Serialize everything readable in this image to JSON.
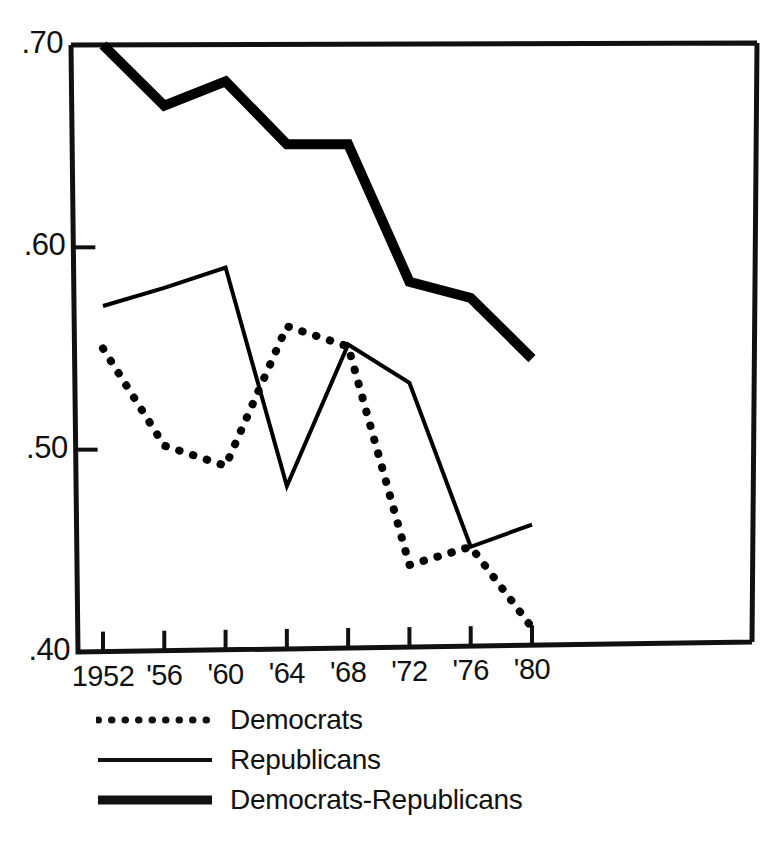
{
  "chart_data": {
    "type": "line",
    "title": "",
    "subtitle": "",
    "xlabel": "",
    "ylabel": "",
    "x": [
      1952,
      1956,
      1960,
      1964,
      1968,
      1972,
      1976,
      1980
    ],
    "categories": [
      "1952",
      "'56",
      "'60",
      "'64",
      "'68",
      "'72",
      "'76",
      "'80"
    ],
    "xlim": [
      1950,
      1982
    ],
    "ylim": [
      0.4,
      0.7
    ],
    "yticks": [
      0.4,
      0.5,
      0.6,
      0.7
    ],
    "ytick_labels": [
      ".40",
      ".50",
      ".60",
      ".70"
    ],
    "grid": false,
    "legend_position": "below-axes",
    "series": [
      {
        "name": "Democrats",
        "style": "dotted",
        "color": "#000000",
        "values": [
          0.55,
          0.502,
          0.492,
          0.561,
          0.551,
          0.443,
          0.452,
          0.412
        ]
      },
      {
        "name": "Republicans",
        "style": "solid-thin",
        "color": "#000000",
        "values": [
          0.571,
          0.58,
          0.59,
          0.482,
          0.552,
          0.533,
          0.452,
          0.463
        ]
      },
      {
        "name": "Democrats-Republicans",
        "style": "solid-thick",
        "color": "#000000",
        "values": [
          0.7,
          0.67,
          0.682,
          0.651,
          0.651,
          0.583,
          0.575,
          0.545
        ]
      }
    ]
  },
  "axes": {
    "ytick_labels": [
      ".70",
      ".60",
      ".50",
      ".40"
    ],
    "xtick_labels": [
      "1952",
      "'56",
      "'60",
      "'64",
      "'68",
      "'72",
      "'76",
      "'80"
    ]
  },
  "legend": {
    "items": [
      {
        "label": "Democrats",
        "style": "dotted"
      },
      {
        "label": "Republicans",
        "style": "solid-thin"
      },
      {
        "label": "Democrats-Republicans",
        "style": "solid-thick"
      }
    ]
  }
}
